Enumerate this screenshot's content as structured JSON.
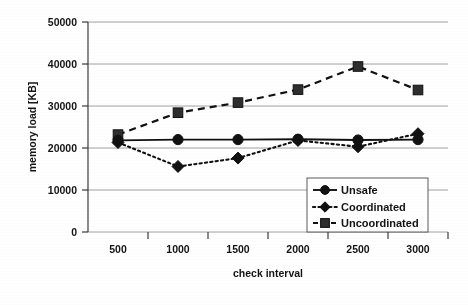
{
  "chart_data": {
    "type": "line",
    "title": "",
    "xlabel": "check interval",
    "ylabel": "memory load [KB]",
    "categories": [
      "500",
      "1000",
      "1500",
      "2000",
      "2500",
      "3000"
    ],
    "x": [
      500,
      1000,
      1500,
      2000,
      2500,
      3000
    ],
    "ylim": [
      0,
      50000
    ],
    "yticks": [
      "0",
      "10000",
      "20000",
      "30000",
      "40000",
      "50000"
    ],
    "ytick_values": [
      0,
      10000,
      20000,
      30000,
      40000,
      50000
    ],
    "xticks": [
      "500",
      "1000",
      "1500",
      "2000",
      "2500",
      "3000"
    ],
    "grid": "horizontal",
    "legend_position": "lower-right-inside",
    "series": [
      {
        "name": "Unsafe",
        "marker": "circle",
        "linestyle": "solid",
        "values": [
          21800,
          22000,
          22000,
          22100,
          21900,
          22000
        ],
        "errors": [
          0,
          0,
          0,
          0,
          0,
          0
        ]
      },
      {
        "name": "Coordinated",
        "marker": "diamond",
        "linestyle": "dotted",
        "values": [
          21300,
          15600,
          17600,
          21800,
          20300,
          23400
        ],
        "errors": [
          0,
          0,
          0,
          0,
          0,
          0
        ]
      },
      {
        "name": "Uncoordinated",
        "marker": "square",
        "linestyle": "dashed",
        "values": [
          23200,
          28400,
          30800,
          33900,
          39400,
          33800
        ],
        "errors": [
          800,
          400,
          300,
          300,
          300,
          300
        ]
      }
    ]
  },
  "legend": {
    "entries": [
      {
        "label": "Unsafe"
      },
      {
        "label": "Coordinated"
      },
      {
        "label": "Uncoordinated"
      }
    ]
  },
  "axes": {
    "y_title": "memory load [KB]",
    "x_title": "check interval"
  }
}
